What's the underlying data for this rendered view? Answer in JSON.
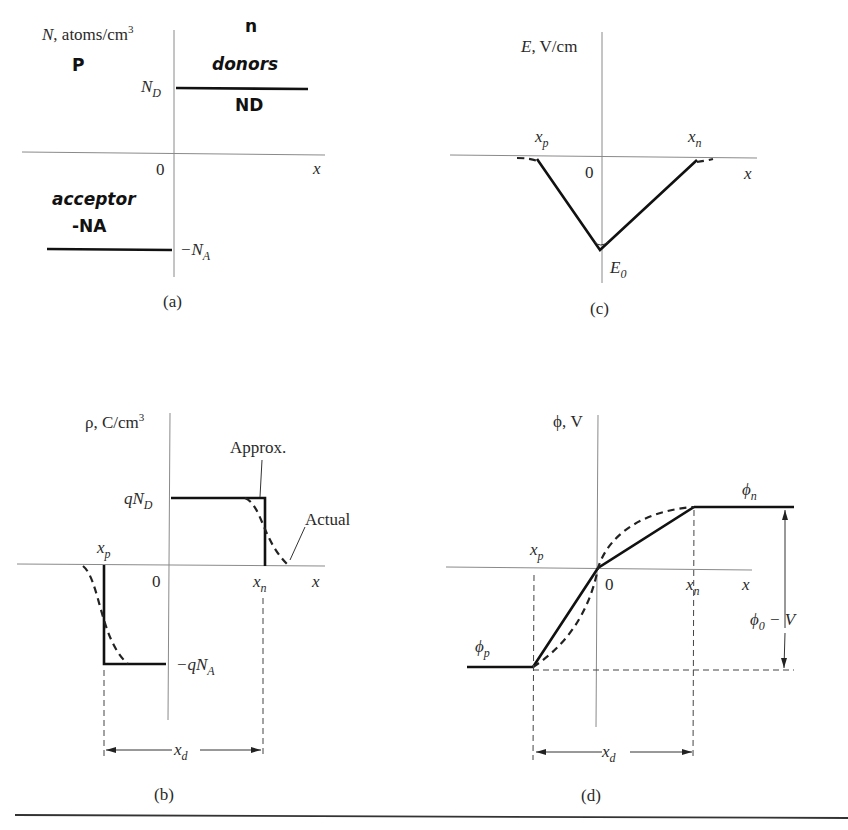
{
  "figure": {
    "rule_color": "#333333",
    "panels": {
      "a": {
        "caption": "(a)",
        "y_label": "N, atoms/cm3",
        "y_label_var": "N",
        "y_label_unit": ", atoms/cm",
        "y_label_exp": "3",
        "x_label": "x",
        "origin": "0",
        "level_top_main": "N",
        "level_top_sub": "D",
        "level_bottom_main": "−N",
        "level_bottom_sub": "A",
        "annotations": {
          "p_side": "P",
          "n_side": "n",
          "donors": "donors",
          "nd": "ND",
          "acceptor": "acceptor",
          "neg_na": "-NA"
        }
      },
      "b": {
        "caption": "(b)",
        "y_label": "ρ, C/cm3",
        "y_label_unit": "ρ, C/cm",
        "y_label_exp": "3",
        "x_label": "x",
        "origin": "0",
        "level_top_main": "qN",
        "level_top_sub": "D",
        "level_bottom_main": "−qN",
        "level_bottom_sub": "A",
        "xp_main": "x",
        "xp_sub": "p",
        "xn_main": "x",
        "xn_sub": "n",
        "xd_main": "x",
        "xd_sub": "d",
        "approx_label": "Approx.",
        "actual_label": "Actual"
      },
      "c": {
        "caption": "(c)",
        "y_label": "E, V/cm",
        "y_label_var": "E",
        "y_label_unit": ", V/cm",
        "x_label": "x",
        "origin": "0",
        "xp_main": "x",
        "xp_sub": "p",
        "xn_main": "x",
        "xn_sub": "n",
        "e0_main": "E",
        "e0_sub": "0"
      },
      "d": {
        "caption": "(d)",
        "y_label": "ϕ, V",
        "x_label": "x",
        "origin": "0",
        "xp_main": "x",
        "xp_sub": "p",
        "xn_main": "x",
        "xn_sub": "n",
        "xd_main": "x",
        "xd_sub": "d",
        "phi_n_main": "ϕ",
        "phi_n_sub": "n",
        "phi_p_main": "ϕ",
        "phi_p_sub": "p",
        "barrier_main": "ϕ",
        "barrier_sub": "0",
        "barrier_rest": " − V"
      }
    }
  }
}
